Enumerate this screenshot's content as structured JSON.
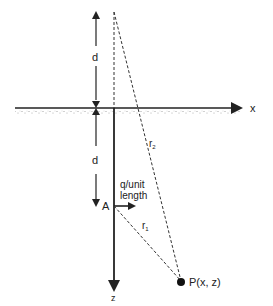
{
  "diagram": {
    "axes": {
      "x_label": "x",
      "z_label": "z"
    },
    "dimensions": {
      "upper_d": "d",
      "lower_d": "d"
    },
    "point_a": {
      "label": "A"
    },
    "line_charge": {
      "label_line1": "q/unit",
      "label_line2": "length"
    },
    "point_p": {
      "label": "P(x, z)"
    },
    "distances": {
      "r1": "r",
      "r1_sub": "1",
      "r2": "r",
      "r2_sub": "2"
    },
    "colors": {
      "ink": "#222222",
      "background": "#ffffff",
      "ground_dots": "#888888"
    }
  }
}
